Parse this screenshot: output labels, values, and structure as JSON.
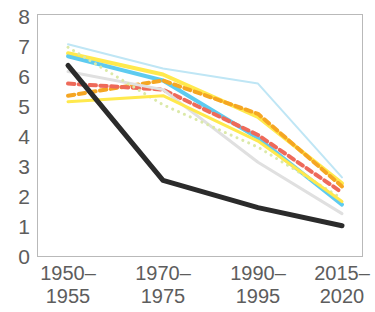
{
  "chart_data": {
    "type": "line",
    "title": "",
    "xlabel": "",
    "ylabel": "",
    "categories": [
      "1950–\n1955",
      "1970–\n1975",
      "1990–\n1995",
      "2015–\n2020"
    ],
    "category_lines": [
      [
        "1950–",
        "1955"
      ],
      [
        "1970–",
        "1975"
      ],
      [
        "1990–",
        "1995"
      ],
      [
        "2015–",
        "2020"
      ]
    ],
    "ylim": [
      0,
      8
    ],
    "xlim": [
      0,
      3
    ],
    "yticks": [
      "8",
      "7",
      "6",
      "5",
      "4",
      "3",
      "2",
      "1",
      "0"
    ],
    "ytick_values": [
      8,
      7,
      6,
      5,
      4,
      3,
      2,
      1,
      0
    ],
    "grid": false,
    "legend": "none",
    "series": [
      {
        "name": "pale-cyan-upper",
        "values": [
          7.0,
          6.2,
          5.7,
          2.6
        ],
        "color": "#bfe6f5",
        "style": "solid",
        "width": 2
      },
      {
        "name": "yellow-upper",
        "values": [
          6.7,
          6.0,
          4.6,
          2.4
        ],
        "color": "#ffe94d",
        "style": "solid",
        "width": 4
      },
      {
        "name": "cyan-main",
        "values": [
          6.6,
          5.8,
          3.9,
          1.7
        ],
        "color": "#5ecbf0",
        "style": "solid",
        "width": 4
      },
      {
        "name": "orange-dashed",
        "values": [
          5.3,
          5.8,
          4.7,
          2.3
        ],
        "color": "#f5a623",
        "style": "dashed",
        "width": 4
      },
      {
        "name": "red-dashed",
        "values": [
          5.7,
          5.5,
          4.0,
          2.1
        ],
        "color": "#ee6a5a",
        "style": "dashed",
        "width": 4
      },
      {
        "name": "grey-faint",
        "values": [
          6.1,
          5.5,
          3.1,
          1.4
        ],
        "color": "#e0e0e0",
        "style": "solid",
        "width": 3
      },
      {
        "name": "pale-green-dotted",
        "values": [
          6.9,
          5.0,
          3.6,
          1.9
        ],
        "color": "#dbe9a8",
        "style": "dotted",
        "width": 3
      },
      {
        "name": "yellow-lower",
        "values": [
          5.1,
          5.3,
          3.8,
          1.8
        ],
        "color": "#ffe94d",
        "style": "solid",
        "width": 3
      },
      {
        "name": "black-main",
        "values": [
          6.3,
          2.5,
          1.6,
          1.0
        ],
        "color": "#2b2b2b",
        "style": "solid",
        "width": 5
      }
    ]
  },
  "axes": {
    "frame_color": "#b9b9b9",
    "tick_text_color": "#5d5d5d"
  }
}
